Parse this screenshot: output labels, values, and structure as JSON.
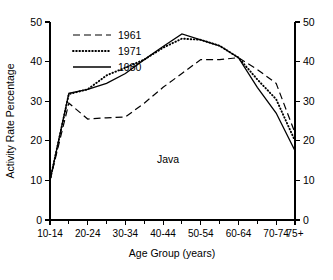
{
  "chart_data": {
    "type": "line",
    "title": "",
    "annotation": "Java",
    "xlabel": "Age Group (years)",
    "ylabel": "Activity Rate Percentage",
    "ylabel_right": "",
    "categories": [
      "10-14",
      "15-19",
      "20-24",
      "25-29",
      "30-34",
      "35-39",
      "40-44",
      "45-49",
      "50-54",
      "55-59",
      "60-64",
      "65-69",
      "70-74",
      "75+"
    ],
    "tick_labels_x": [
      "10-14",
      "20-24",
      "30-34",
      "40-44",
      "50-54",
      "60-64",
      "70-74",
      "75+"
    ],
    "ylim": [
      0,
      50
    ],
    "yticks": [
      0,
      10,
      20,
      30,
      40,
      50
    ],
    "yticks_right": [
      0,
      10,
      20,
      30,
      40,
      50
    ],
    "grid": false,
    "legend_position": "top-left",
    "series": [
      {
        "name": "1961",
        "style": "dashed",
        "values": [
          10.0,
          29.5,
          25.5,
          25.8,
          26.0,
          29.5,
          33.5,
          37.0,
          40.5,
          40.5,
          41.0,
          38.0,
          34.5,
          22.0
        ]
      },
      {
        "name": "1971",
        "style": "dotted",
        "values": [
          10.0,
          31.8,
          33.0,
          36.5,
          38.5,
          40.5,
          43.5,
          45.8,
          45.5,
          44.0,
          41.0,
          35.5,
          30.5,
          20.0
        ]
      },
      {
        "name": "1980",
        "style": "solid",
        "values": [
          10.0,
          32.0,
          33.0,
          34.5,
          37.0,
          40.5,
          43.8,
          47.0,
          45.5,
          44.0,
          41.0,
          33.5,
          27.0,
          17.5
        ]
      }
    ]
  },
  "legend": {
    "entries": [
      {
        "label": "1961",
        "style": "dashed"
      },
      {
        "label": "1971",
        "style": "dotted"
      },
      {
        "label": "1980",
        "style": "solid"
      }
    ]
  },
  "colors": {
    "ink": "#000000",
    "background": "#ffffff"
  }
}
